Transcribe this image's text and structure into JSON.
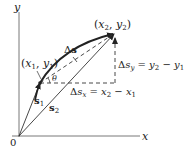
{
  "diagram": {
    "type": "displacement-vector-diagram",
    "axes": {
      "x_label": "x",
      "y_label": "y",
      "origin_label": "0"
    },
    "points": {
      "p1": {
        "label_open": "(",
        "x": "x",
        "x_sub": "1",
        "sep": ", ",
        "y": "y",
        "y_sub": "1",
        "label_close": ")"
      },
      "p2": {
        "label_open": "(",
        "x": "x",
        "x_sub": "2",
        "sep": ", ",
        "y": "y",
        "y_sub": "2",
        "label_close": ")"
      }
    },
    "vectors": {
      "s1": {
        "name": "s",
        "sub": "1"
      },
      "s2": {
        "name": "s",
        "sub": "2"
      },
      "ds": {
        "delta": "Δ",
        "name": "s"
      }
    },
    "angle": {
      "symbol": "θ"
    },
    "delta_x": {
      "delta": "Δ",
      "s": "s",
      "sub": "x",
      "eq": " = ",
      "a": "x",
      "a_sub": "2",
      "minus": " − ",
      "b": "x",
      "b_sub": "1"
    },
    "delta_y": {
      "delta": "Δ",
      "s": "s",
      "sub": "y",
      "eq": " = ",
      "a": "y",
      "a_sub": "2",
      "minus": " − ",
      "b": "y",
      "b_sub": "1"
    },
    "colors": {
      "line": "#222222",
      "background": "#ffffff"
    }
  }
}
